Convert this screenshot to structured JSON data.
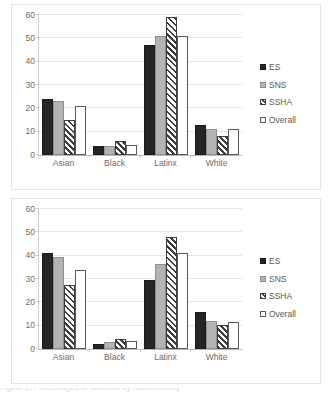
{
  "figure": {
    "background_color": "#ffffff",
    "panel_border_color": "#e3e3e3",
    "caption_partial": "Figure 2. Percentages of students by race/ethnicity"
  },
  "series_styles": {
    "ES": "#252525",
    "SNS": "#b3b3b3",
    "SSHA": "hatched-diagonal",
    "Overall": "#ffffff"
  },
  "chart_data": [
    {
      "id": "chart-top",
      "type": "bar",
      "title": "",
      "subtitle": "",
      "xlabel": "",
      "ylabel": "",
      "categories": [
        "Asian",
        "Black",
        "Latinx",
        "White"
      ],
      "series": [
        {
          "name": "ES",
          "values": [
            24,
            4,
            47,
            13
          ]
        },
        {
          "name": "SNS",
          "values": [
            23,
            4,
            51,
            11
          ]
        },
        {
          "name": "SSHA",
          "values": [
            15,
            6,
            59,
            8
          ]
        },
        {
          "name": "Overall",
          "values": [
            21,
            4.5,
            51,
            11
          ]
        }
      ],
      "ylim": [
        0,
        60
      ],
      "yticks": [
        0,
        10,
        20,
        30,
        40,
        50,
        60
      ],
      "ytick_labels": [
        "0",
        "10",
        "20",
        "30",
        "40",
        "50",
        "60"
      ],
      "grid": true,
      "legend_position": "right",
      "legend_entries": [
        "ES",
        "SNS",
        "SSHA",
        "Overall"
      ]
    },
    {
      "id": "chart-bottom",
      "type": "bar",
      "title": "",
      "subtitle": "",
      "xlabel": "",
      "ylabel": "",
      "categories": [
        "Asian",
        "Black",
        "Latinx",
        "White"
      ],
      "series": [
        {
          "name": "ES",
          "values": [
            41,
            2.2,
            29.7,
            16
          ]
        },
        {
          "name": "SNS",
          "values": [
            39.3,
            3,
            36.4,
            12.2
          ]
        },
        {
          "name": "SSHA",
          "values": [
            27.3,
            4.2,
            48,
            10.4
          ]
        },
        {
          "name": "Overall",
          "values": [
            33.7,
            3.4,
            41.2,
            11.5
          ]
        }
      ],
      "ylim": [
        0,
        60
      ],
      "yticks": [
        0,
        10,
        20,
        30,
        40,
        50,
        60
      ],
      "ytick_labels": [
        "0",
        "10",
        "20",
        "30",
        "40",
        "50",
        "60"
      ],
      "grid": true,
      "legend_position": "right",
      "legend_entries": [
        "ES",
        "SNS",
        "SSHA",
        "Overall"
      ]
    }
  ]
}
